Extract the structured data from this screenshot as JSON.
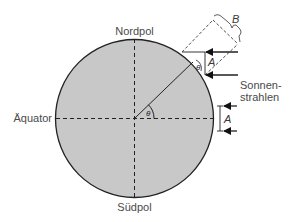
{
  "diagram": {
    "labels": {
      "north": "Nordpol",
      "south": "Südpol",
      "equator": "Äquator",
      "sun_rays_line1": "Sonnen-",
      "sun_rays_line2": "strahlen",
      "width_A_top": "A",
      "width_A_equator": "A",
      "width_B": "B",
      "angle_center": "θ",
      "angle_surface": "θ"
    },
    "colors": {
      "earth_fill": "#c8c8c8",
      "stroke": "#222222",
      "text": "#4a4a4a"
    }
  }
}
